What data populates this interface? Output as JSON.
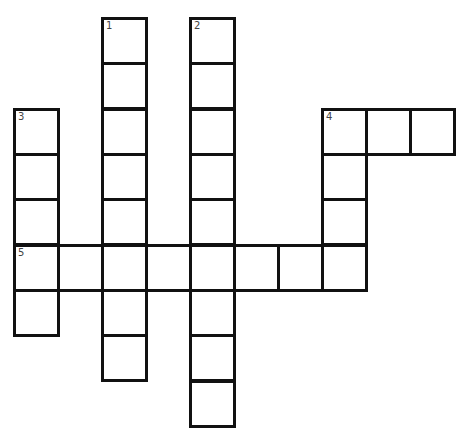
{
  "puzzle": {
    "type": "crossword",
    "grid": {
      "origin_x": 13,
      "origin_y": 17,
      "cell_w": 44,
      "cell_h": 45.35,
      "cells": [
        {
          "col": 2,
          "row": 0,
          "number": "1"
        },
        {
          "col": 2,
          "row": 1
        },
        {
          "col": 2,
          "row": 2
        },
        {
          "col": 2,
          "row": 3
        },
        {
          "col": 2,
          "row": 4
        },
        {
          "col": 2,
          "row": 5
        },
        {
          "col": 2,
          "row": 6
        },
        {
          "col": 2,
          "row": 7
        },
        {
          "col": 4,
          "row": 0,
          "number": "2"
        },
        {
          "col": 4,
          "row": 1
        },
        {
          "col": 4,
          "row": 2
        },
        {
          "col": 4,
          "row": 3
        },
        {
          "col": 4,
          "row": 4
        },
        {
          "col": 4,
          "row": 5
        },
        {
          "col": 4,
          "row": 6
        },
        {
          "col": 4,
          "row": 7
        },
        {
          "col": 4,
          "row": 8
        },
        {
          "col": 0,
          "row": 2,
          "number": "3"
        },
        {
          "col": 0,
          "row": 3
        },
        {
          "col": 0,
          "row": 4
        },
        {
          "col": 0,
          "row": 5,
          "number": "5"
        },
        {
          "col": 0,
          "row": 6
        },
        {
          "col": 7,
          "row": 2,
          "number": "4"
        },
        {
          "col": 8,
          "row": 2
        },
        {
          "col": 9,
          "row": 2
        },
        {
          "col": 7,
          "row": 3
        },
        {
          "col": 7,
          "row": 4
        },
        {
          "col": 7,
          "row": 5
        },
        {
          "col": 1,
          "row": 5
        },
        {
          "col": 3,
          "row": 5
        },
        {
          "col": 5,
          "row": 5
        },
        {
          "col": 6,
          "row": 5
        }
      ]
    },
    "clue_numbers": [
      "1",
      "2",
      "3",
      "4",
      "5"
    ],
    "entries": [
      {
        "number": "1",
        "direction": "down",
        "length": 8
      },
      {
        "number": "2",
        "direction": "down",
        "length": 9
      },
      {
        "number": "3",
        "direction": "down",
        "length": 5
      },
      {
        "number": "4",
        "direction": "across",
        "length": 3
      },
      {
        "number": "4",
        "direction": "down",
        "length": 4
      },
      {
        "number": "5",
        "direction": "across",
        "length": 8
      }
    ],
    "colors": {
      "border": "#111111",
      "cell_fill": "#ffffff",
      "number": "#444444"
    }
  }
}
